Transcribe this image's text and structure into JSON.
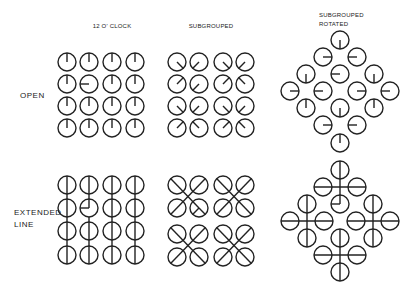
{
  "figure": {
    "column_labels": [
      {
        "id": "twelve",
        "lines": [
          "12  O' CLOCK"
        ],
        "x": 112,
        "y": 24
      },
      {
        "id": "subgrouped",
        "lines": [
          "SUBGROUPED"
        ],
        "x": 211,
        "y": 24
      },
      {
        "id": "subgrouped_rotated",
        "lines": [
          "SUBGROUPED",
          "ROTATED"
        ],
        "x": 318,
        "y": 11
      }
    ],
    "row_labels": [
      {
        "id": "open",
        "lines": [
          "OPEN"
        ],
        "x": 20,
        "y": 91
      },
      {
        "id": "extended",
        "lines": [
          "EXTENDED",
          "LINE"
        ],
        "x": 14,
        "y": 210
      }
    ],
    "style": {
      "stroke": "#222222",
      "radius": 9,
      "stroke_width": 1.4
    },
    "panels": {
      "open_twelve": {
        "dials": [
          {
            "x": 67,
            "y": 62,
            "dir": "N"
          },
          {
            "x": 89,
            "y": 62,
            "dir": "N"
          },
          {
            "x": 112,
            "y": 62,
            "dir": "N"
          },
          {
            "x": 135,
            "y": 62,
            "dir": "N"
          },
          {
            "x": 67,
            "y": 84,
            "dir": "N"
          },
          {
            "x": 89,
            "y": 84,
            "dir": "W"
          },
          {
            "x": 112,
            "y": 84,
            "dir": "N"
          },
          {
            "x": 135,
            "y": 84,
            "dir": "N"
          },
          {
            "x": 67,
            "y": 106,
            "dir": "N"
          },
          {
            "x": 89,
            "y": 106,
            "dir": "N"
          },
          {
            "x": 112,
            "y": 106,
            "dir": "N"
          },
          {
            "x": 135,
            "y": 106,
            "dir": "N"
          },
          {
            "x": 67,
            "y": 128,
            "dir": "N"
          },
          {
            "x": 89,
            "y": 128,
            "dir": "N"
          },
          {
            "x": 112,
            "y": 128,
            "dir": "N"
          },
          {
            "x": 135,
            "y": 128,
            "dir": "N"
          }
        ]
      },
      "open_subgrouped": {
        "dials": [
          {
            "x": 177,
            "y": 62,
            "dir": "SE"
          },
          {
            "x": 199,
            "y": 62,
            "dir": "SW"
          },
          {
            "x": 223,
            "y": 62,
            "dir": "SE"
          },
          {
            "x": 245,
            "y": 62,
            "dir": "SW"
          },
          {
            "x": 177,
            "y": 84,
            "dir": "NE"
          },
          {
            "x": 199,
            "y": 84,
            "dir": "SW"
          },
          {
            "x": 223,
            "y": 84,
            "dir": "NE"
          },
          {
            "x": 245,
            "y": 84,
            "dir": "NW"
          },
          {
            "x": 177,
            "y": 106,
            "dir": "SE"
          },
          {
            "x": 199,
            "y": 106,
            "dir": "SW"
          },
          {
            "x": 223,
            "y": 106,
            "dir": "SE"
          },
          {
            "x": 245,
            "y": 106,
            "dir": "SW"
          },
          {
            "x": 177,
            "y": 128,
            "dir": "NE"
          },
          {
            "x": 199,
            "y": 128,
            "dir": "NW"
          },
          {
            "x": 223,
            "y": 128,
            "dir": "NE"
          },
          {
            "x": 245,
            "y": 128,
            "dir": "NW"
          }
        ]
      },
      "open_rotated": {
        "dials": [
          {
            "x": 340,
            "y": 40,
            "dir": "S"
          },
          {
            "x": 323,
            "y": 57,
            "dir": "E"
          },
          {
            "x": 357,
            "y": 57,
            "dir": "W"
          },
          {
            "x": 306,
            "y": 74,
            "dir": "S"
          },
          {
            "x": 340,
            "y": 74,
            "dir": "W"
          },
          {
            "x": 374,
            "y": 74,
            "dir": "S"
          },
          {
            "x": 290,
            "y": 91,
            "dir": "E"
          },
          {
            "x": 323,
            "y": 91,
            "dir": "W"
          },
          {
            "x": 357,
            "y": 91,
            "dir": "E"
          },
          {
            "x": 390,
            "y": 91,
            "dir": "W"
          },
          {
            "x": 306,
            "y": 108,
            "dir": "N"
          },
          {
            "x": 340,
            "y": 108,
            "dir": "S"
          },
          {
            "x": 374,
            "y": 108,
            "dir": "N"
          },
          {
            "x": 323,
            "y": 125,
            "dir": "E"
          },
          {
            "x": 357,
            "y": 125,
            "dir": "W"
          },
          {
            "x": 340,
            "y": 143,
            "dir": "N"
          }
        ]
      },
      "extended_twelve": {
        "circles": [
          {
            "x": 67,
            "y": 185
          },
          {
            "x": 89,
            "y": 185
          },
          {
            "x": 112,
            "y": 185
          },
          {
            "x": 135,
            "y": 185
          },
          {
            "x": 67,
            "y": 208
          },
          {
            "x": 89,
            "y": 208,
            "odd": "NW_hook"
          },
          {
            "x": 112,
            "y": 208
          },
          {
            "x": 135,
            "y": 208
          },
          {
            "x": 67,
            "y": 231
          },
          {
            "x": 89,
            "y": 231
          },
          {
            "x": 112,
            "y": 231
          },
          {
            "x": 135,
            "y": 231
          },
          {
            "x": 67,
            "y": 255
          },
          {
            "x": 89,
            "y": 255
          },
          {
            "x": 112,
            "y": 255
          },
          {
            "x": 135,
            "y": 255
          }
        ],
        "lines": [
          {
            "x1": 67,
            "y1": 176,
            "x2": 67,
            "y2": 264
          },
          {
            "x1": 89,
            "y1": 176,
            "x2": 89,
            "y2": 208
          },
          {
            "x1": 89,
            "y1": 217,
            "x2": 89,
            "y2": 264
          },
          {
            "x1": 112,
            "y1": 176,
            "x2": 112,
            "y2": 264
          },
          {
            "x1": 135,
            "y1": 176,
            "x2": 135,
            "y2": 264
          },
          {
            "x1": 89,
            "y1": 208,
            "x2": 80,
            "y2": 208
          }
        ]
      },
      "extended_subgrouped": {
        "circles": [
          {
            "x": 177,
            "y": 185
          },
          {
            "x": 199,
            "y": 185
          },
          {
            "x": 223,
            "y": 185
          },
          {
            "x": 245,
            "y": 185
          },
          {
            "x": 177,
            "y": 208
          },
          {
            "x": 199,
            "y": 208,
            "odd": "caret"
          },
          {
            "x": 223,
            "y": 208
          },
          {
            "x": 245,
            "y": 208
          },
          {
            "x": 177,
            "y": 234
          },
          {
            "x": 199,
            "y": 234
          },
          {
            "x": 223,
            "y": 234
          },
          {
            "x": 245,
            "y": 234
          },
          {
            "x": 177,
            "y": 257
          },
          {
            "x": 199,
            "y": 257
          },
          {
            "x": 223,
            "y": 257
          },
          {
            "x": 245,
            "y": 257
          }
        ],
        "lines": [
          {
            "x1": 170.6,
            "y1": 178.6,
            "x2": 199,
            "y2": 208
          },
          {
            "x1": 205.4,
            "y1": 178.6,
            "x2": 170.6,
            "y2": 214.4
          },
          {
            "x1": 199,
            "y1": 208,
            "x2": 192.6,
            "y2": 214.4
          },
          {
            "x1": 199,
            "y1": 208,
            "x2": 205.4,
            "y2": 214.4
          },
          {
            "x1": 216.6,
            "y1": 178.6,
            "x2": 251.4,
            "y2": 214.4
          },
          {
            "x1": 251.4,
            "y1": 178.6,
            "x2": 216.6,
            "y2": 214.4
          },
          {
            "x1": 170.6,
            "y1": 227.6,
            "x2": 205.4,
            "y2": 263.4
          },
          {
            "x1": 205.4,
            "y1": 227.6,
            "x2": 170.6,
            "y2": 263.4
          },
          {
            "x1": 216.6,
            "y1": 227.6,
            "x2": 251.4,
            "y2": 263.4
          },
          {
            "x1": 251.4,
            "y1": 227.6,
            "x2": 216.6,
            "y2": 263.4
          }
        ]
      },
      "extended_rotated": {
        "circles": [
          {
            "x": 340,
            "y": 170
          },
          {
            "x": 323,
            "y": 187
          },
          {
            "x": 357,
            "y": 187
          },
          {
            "x": 340,
            "y": 204,
            "odd": "W_hook"
          },
          {
            "x": 307,
            "y": 204
          },
          {
            "x": 290,
            "y": 221
          },
          {
            "x": 324,
            "y": 221
          },
          {
            "x": 307,
            "y": 238
          },
          {
            "x": 373,
            "y": 204
          },
          {
            "x": 356,
            "y": 221
          },
          {
            "x": 390,
            "y": 221
          },
          {
            "x": 373,
            "y": 238
          },
          {
            "x": 340,
            "y": 238
          },
          {
            "x": 323,
            "y": 255
          },
          {
            "x": 357,
            "y": 255
          },
          {
            "x": 340,
            "y": 272
          }
        ],
        "lines": [
          {
            "x1": 340,
            "y1": 161,
            "x2": 340,
            "y2": 204
          },
          {
            "x1": 314,
            "y1": 187,
            "x2": 366,
            "y2": 187
          },
          {
            "x1": 340,
            "y1": 204,
            "x2": 331,
            "y2": 204
          },
          {
            "x1": 307,
            "y1": 195,
            "x2": 307,
            "y2": 247
          },
          {
            "x1": 281,
            "y1": 221,
            "x2": 333,
            "y2": 221
          },
          {
            "x1": 373,
            "y1": 195,
            "x2": 373,
            "y2": 247
          },
          {
            "x1": 347,
            "y1": 221,
            "x2": 399,
            "y2": 221
          },
          {
            "x1": 340,
            "y1": 229,
            "x2": 340,
            "y2": 281
          },
          {
            "x1": 314,
            "y1": 255,
            "x2": 366,
            "y2": 255
          }
        ]
      }
    }
  }
}
